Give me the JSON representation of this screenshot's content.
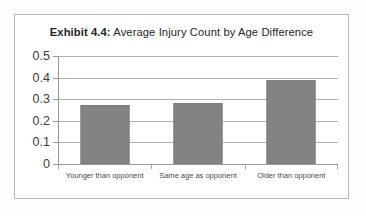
{
  "figure": {
    "frame_color": "#b9b9b9",
    "background_color": "#ffffff"
  },
  "title": {
    "label_strong": "Exhibit 4.4:",
    "label_rest": " Average Injury Count by Age Difference",
    "full": "Exhibit 4.4: Average Injury Count by Age Difference"
  },
  "axis": {
    "y_ticks": [
      "0.5",
      "0.4",
      "0.3",
      "0.2",
      "0.1",
      "0"
    ]
  },
  "chart_data": {
    "type": "bar",
    "title": "Exhibit 4.4: Average Injury Count by Age Difference",
    "categories": [
      "Younger than opponent",
      "Same age as opponent",
      "Older than opponent"
    ],
    "values": [
      0.275,
      0.283,
      0.39
    ],
    "series": [
      {
        "name": "Average Injury Count",
        "values": [
          0.275,
          0.283,
          0.39
        ]
      }
    ],
    "xlabel": "",
    "ylabel": "",
    "ylim": [
      0,
      0.5
    ],
    "ytick_values": [
      0,
      0.1,
      0.2,
      0.3,
      0.4,
      0.5
    ],
    "ytick_labels": [
      "0",
      "0.1",
      "0.2",
      "0.3",
      "0.4",
      "0.5"
    ],
    "grid": true,
    "grid_axis": "y",
    "legend": false,
    "legend_position": "none",
    "bar_color": "#838383",
    "bar_edge_color": "#7c7c7c",
    "gridline_color": "#b0b0b0"
  }
}
